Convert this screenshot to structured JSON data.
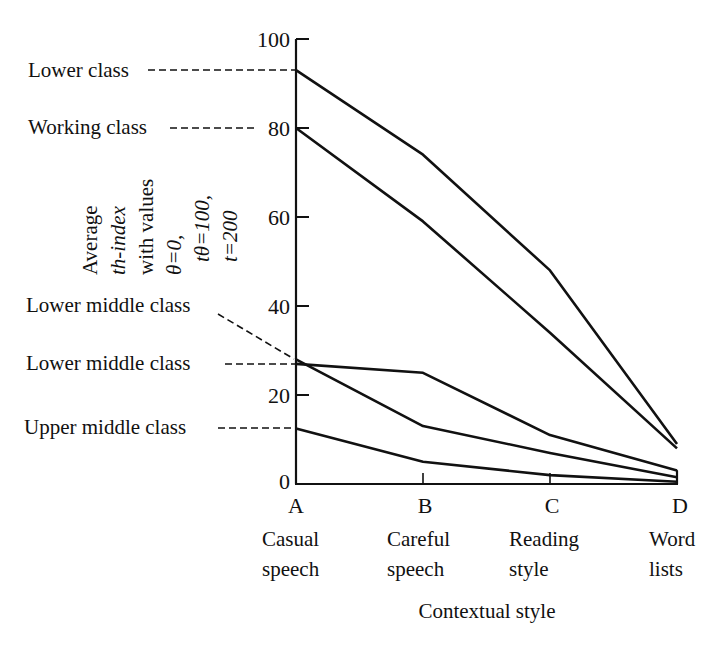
{
  "chart_data": {
    "type": "line",
    "title": "",
    "xlabel": "Contextual style",
    "ylabel_lines": [
      "Average",
      "th-index",
      "with values",
      "θ=0,",
      "tθ=100,",
      "t=200"
    ],
    "categories": [
      {
        "letter": "A",
        "line1": "Casual",
        "line2": "speech"
      },
      {
        "letter": "B",
        "line1": "Careful",
        "line2": "speech"
      },
      {
        "letter": "C",
        "line1": "Reading",
        "line2": "style"
      },
      {
        "letter": "D",
        "line1": "Word",
        "line2": "lists"
      }
    ],
    "yticks": [
      0,
      20,
      40,
      60,
      80,
      100
    ],
    "ylim": [
      0,
      100
    ],
    "grid": false,
    "legend": "direct labels at left with dashed leader lines",
    "series": [
      {
        "name": "Lower class",
        "values": [
          93,
          74,
          48,
          9
        ]
      },
      {
        "name": "Working class",
        "values": [
          80,
          59,
          34,
          8
        ]
      },
      {
        "name": "Lower middle class",
        "values": [
          27,
          25,
          11,
          3
        ]
      },
      {
        "name": "Lower middle class",
        "values": [
          28,
          13,
          7,
          1.5
        ]
      },
      {
        "name": "Upper middle class",
        "values": [
          12.5,
          5,
          2,
          0.5
        ]
      }
    ],
    "line_color": "#111111"
  },
  "labels": {
    "lower_class": "Lower class",
    "working_class": "Working class",
    "lower_middle_class_a": "Lower middle class",
    "lower_middle_class_b": "Lower middle class",
    "upper_middle_class": "Upper middle class"
  }
}
